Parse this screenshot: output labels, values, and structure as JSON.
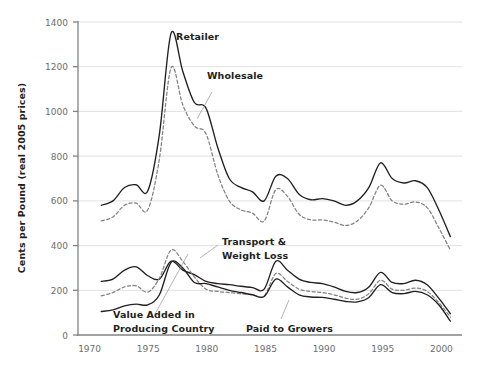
{
  "chart_data": {
    "type": "line",
    "title": "",
    "xlabel": "",
    "ylabel": "Cents per Pound (real 2005 prices)",
    "xlim": [
      1969,
      2002
    ],
    "ylim": [
      0,
      1400
    ],
    "ytick_labels": [
      "0",
      "200",
      "400",
      "600",
      "800",
      "1000",
      "1200",
      "1400"
    ],
    "ytick_values": [
      0,
      200,
      400,
      600,
      800,
      1000,
      1200,
      1400
    ],
    "xtick_labels": [
      "1970",
      "1975",
      "1980",
      "1985",
      "1990",
      "1995",
      "2000"
    ],
    "xtick_values": [
      1970,
      1975,
      1980,
      1985,
      1990,
      1995,
      2000
    ],
    "grid": "horizontal",
    "legend_position": "inline-annotations",
    "x": [
      1971,
      1972,
      1973,
      1974,
      1975,
      1976,
      1977,
      1978,
      1979,
      1980,
      1981,
      1982,
      1983,
      1984,
      1985,
      1986,
      1987,
      1988,
      1989,
      1990,
      1991,
      1992,
      1993,
      1994,
      1995,
      1996,
      1997,
      1998,
      1999,
      2000,
      2001
    ],
    "series": [
      {
        "name": "Retailer",
        "style": "solid",
        "color": "#231f20",
        "values": [
          580,
          600,
          660,
          672,
          645,
          900,
          1350,
          1180,
          1040,
          1015,
          840,
          700,
          660,
          640,
          600,
          710,
          700,
          630,
          605,
          610,
          600,
          580,
          600,
          660,
          770,
          700,
          680,
          690,
          660,
          560,
          440
        ]
      },
      {
        "name": "Wholesale",
        "style": "dashed",
        "color": "#808285",
        "values": [
          510,
          528,
          580,
          590,
          560,
          790,
          1195,
          1030,
          935,
          900,
          720,
          600,
          560,
          545,
          510,
          650,
          620,
          540,
          515,
          515,
          505,
          490,
          510,
          570,
          670,
          600,
          585,
          595,
          570,
          480,
          380
        ]
      },
      {
        "name": "Transport & Weight Loss",
        "style": "solid",
        "color": "#231f20",
        "values": [
          240,
          250,
          290,
          305,
          265,
          250,
          330,
          290,
          270,
          240,
          230,
          225,
          218,
          212,
          205,
          330,
          290,
          250,
          235,
          230,
          215,
          195,
          190,
          215,
          280,
          235,
          230,
          245,
          225,
          165,
          95
        ]
      },
      {
        "name": "Value Added in Producing Country",
        "style": "dashed",
        "color": "#808285",
        "values": [
          175,
          190,
          215,
          220,
          192,
          255,
          380,
          330,
          260,
          205,
          195,
          190,
          185,
          180,
          175,
          275,
          240,
          205,
          195,
          190,
          180,
          165,
          160,
          185,
          245,
          205,
          200,
          210,
          195,
          145,
          80
        ]
      },
      {
        "name": "Paid to Growers",
        "style": "solid",
        "color": "#231f20",
        "values": [
          105,
          112,
          130,
          138,
          135,
          180,
          325,
          300,
          235,
          230,
          215,
          200,
          190,
          180,
          172,
          250,
          215,
          180,
          170,
          168,
          160,
          150,
          148,
          168,
          225,
          190,
          185,
          195,
          180,
          135,
          62
        ]
      }
    ],
    "annotations": [
      {
        "id": "retailer",
        "label": "Retailer"
      },
      {
        "id": "wholesale",
        "label": "Wholesale"
      },
      {
        "id": "transport",
        "label": "Transport &"
      },
      {
        "id": "transport2",
        "label": "Weight Loss"
      },
      {
        "id": "value-added",
        "label": "Value Added in"
      },
      {
        "id": "value-added2",
        "label": "Producing Country"
      },
      {
        "id": "paid-growers",
        "label": "Paid to Growers"
      }
    ],
    "colors": {
      "solid_line": "#231f20",
      "dashed_line": "#808285",
      "gridline": "#d9d9d9",
      "axis": "#808285",
      "tick_text": "#6d6e71",
      "label_text": "#231f20",
      "background": "#ffffff"
    }
  }
}
